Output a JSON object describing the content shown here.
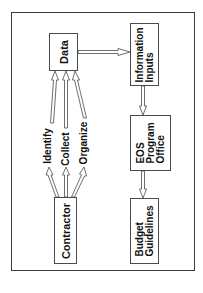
{
  "diagram": {
    "nodes": {
      "data": {
        "label": "Data"
      },
      "information_inputs": {
        "line1": "Information",
        "line2": "Inputs"
      },
      "eos_program_office": {
        "line1": "EOS",
        "line2": "Program",
        "line3": "Office"
      },
      "budget_guidelines": {
        "line1": "Budget",
        "line2": "Guidelines"
      },
      "contractor": {
        "label": "Contractor"
      }
    },
    "edge_labels": {
      "identify": "Identify",
      "collect": "Collect",
      "organize": "Organize"
    },
    "edges": [
      {
        "from": "Contractor",
        "to": "Data",
        "label": "Identify"
      },
      {
        "from": "Contractor",
        "to": "Data",
        "label": "Collect"
      },
      {
        "from": "Contractor",
        "to": "Data",
        "label": "Organize"
      },
      {
        "from": "Data",
        "to": "Information Inputs"
      },
      {
        "from": "Information Inputs",
        "to": "EOS Program Office"
      },
      {
        "from": "EOS Program Office",
        "to": "Budget Guidelines"
      }
    ],
    "colors": {
      "line": "#4a4a4a",
      "text": "#111111",
      "background": "#ffffff"
    }
  }
}
